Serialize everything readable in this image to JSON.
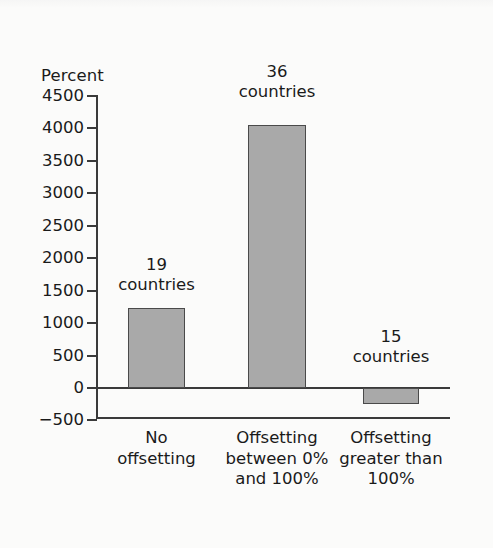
{
  "chart_data": {
    "type": "bar",
    "title": "",
    "xlabel": "",
    "ylabel": "Percent",
    "ylim": [
      -500,
      4500
    ],
    "ytick_labels": [
      "4500",
      "4000",
      "3500",
      "3000",
      "2500",
      "2000",
      "1500",
      "1000",
      "500",
      "0",
      "−500"
    ],
    "ytick_values": [
      4500,
      4000,
      3500,
      3000,
      2500,
      2000,
      1500,
      1000,
      500,
      0,
      -500
    ],
    "grid": false,
    "legend": null,
    "categories": [
      "No\noffsetting",
      "Offsetting\nbetween 0%\nand 100%",
      "Offsetting\ngreater than\n100%"
    ],
    "values": [
      1240,
      4060,
      -240
    ],
    "annotations": [
      "19\ncountries",
      "36\ncountries",
      "15\ncountries"
    ],
    "bar_color": "#a9a9a9",
    "bar_edge_color": "#4a4a4a",
    "axis_color": "#3a3a3a",
    "background_color": "#fbfbfa"
  }
}
